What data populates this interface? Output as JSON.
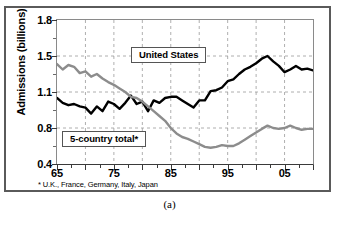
{
  "figure": {
    "caption": "(a)",
    "footnote": "* U.K., France, Germany, Italy, Japan"
  },
  "chart_data": {
    "type": "line",
    "title": "",
    "xlabel": "",
    "ylabel": "Admissions (billions)",
    "ylim": [
      0.4,
      1.8
    ],
    "xlim": [
      1965,
      2010
    ],
    "ytick_labels": [
      "1.8",
      "1.5",
      "1.1",
      "0.8",
      "0.4"
    ],
    "ytick_values": [
      1.8,
      1.5,
      1.1,
      0.8,
      0.4
    ],
    "xtick_labels": [
      "65",
      "75",
      "85",
      "95",
      "05"
    ],
    "xtick_values": [
      1965,
      1975,
      1985,
      1995,
      2005
    ],
    "minor_xtick_interval": 2.5,
    "grid": "dashed vertical every 5 years, dashed horizontal at major y ticks",
    "legend_position": "inline-boxed-labels",
    "annotations": [
      {
        "text": "United States",
        "x": 1982,
        "y": 1.52
      },
      {
        "text": "5-country total*",
        "x": 1972,
        "y": 0.62
      }
    ],
    "series": [
      {
        "name": "United States",
        "color": "#000000",
        "linewidth": 2.4,
        "x": [
          1965,
          1966,
          1967,
          1968,
          1969,
          1970,
          1971,
          1972,
          1973,
          1974,
          1975,
          1976,
          1977,
          1978,
          1979,
          1980,
          1981,
          1982,
          1983,
          1984,
          1985,
          1986,
          1987,
          1988,
          1989,
          1990,
          1991,
          1992,
          1993,
          1994,
          1995,
          1996,
          1997,
          1998,
          1999,
          2000,
          2001,
          2002,
          2003,
          2004,
          2005,
          2006,
          2007,
          2008,
          2009,
          2010
        ],
        "values": [
          1.05,
          1.01,
          0.99,
          1.0,
          0.98,
          0.97,
          0.92,
          0.98,
          0.94,
          1.02,
          1.0,
          0.96,
          1.01,
          1.07,
          1.0,
          1.02,
          0.94,
          1.03,
          1.01,
          1.05,
          1.06,
          1.06,
          1.03,
          1.0,
          0.97,
          1.03,
          1.03,
          1.11,
          1.12,
          1.15,
          1.22,
          1.24,
          1.3,
          1.35,
          1.38,
          1.42,
          1.47,
          1.5,
          1.44,
          1.39,
          1.32,
          1.35,
          1.39,
          1.35,
          1.36,
          1.34
        ],
        "label_note": "US admissions peak ~1.63 in 2002"
      },
      {
        "name": "5-country total",
        "color": "#8c8c8c",
        "linewidth": 2.4,
        "x": [
          1965,
          1966,
          1967,
          1968,
          1969,
          1970,
          1971,
          1972,
          1973,
          1974,
          1975,
          1976,
          1977,
          1978,
          1979,
          1980,
          1981,
          1982,
          1983,
          1984,
          1985,
          1986,
          1987,
          1988,
          1989,
          1990,
          1991,
          1992,
          1993,
          1994,
          1995,
          1996,
          1997,
          1998,
          1999,
          2000,
          2001,
          2002,
          2003,
          2004,
          2005,
          2006,
          2007,
          2008,
          2009,
          2010
        ],
        "values": [
          1.41,
          1.35,
          1.4,
          1.38,
          1.31,
          1.33,
          1.27,
          1.3,
          1.25,
          1.21,
          1.18,
          1.14,
          1.1,
          1.06,
          1.05,
          1.02,
          0.98,
          0.94,
          0.9,
          0.86,
          0.8,
          0.74,
          0.7,
          0.68,
          0.65,
          0.62,
          0.59,
          0.58,
          0.59,
          0.61,
          0.6,
          0.6,
          0.63,
          0.67,
          0.71,
          0.75,
          0.79,
          0.82,
          0.8,
          0.79,
          0.8,
          0.82,
          0.8,
          0.78,
          0.79,
          0.79
        ]
      }
    ]
  }
}
